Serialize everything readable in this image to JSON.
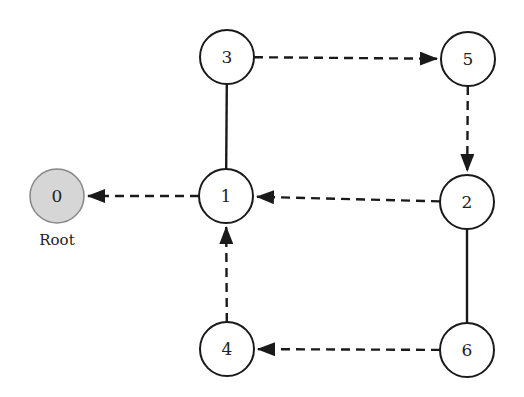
{
  "diagram": {
    "title": "",
    "colors": {
      "stroke": "#1a1a1a",
      "node_fill": "#ffffff",
      "root_fill": "#d6d6d6",
      "background": "#ffffff"
    },
    "nodes": [
      {
        "id": "0",
        "label": "0",
        "x": 57,
        "y": 196,
        "root": true,
        "caption": "Root"
      },
      {
        "id": "1",
        "label": "1",
        "x": 226,
        "y": 196
      },
      {
        "id": "2",
        "label": "2",
        "x": 467,
        "y": 202
      },
      {
        "id": "3",
        "label": "3",
        "x": 227,
        "y": 57
      },
      {
        "id": "4",
        "label": "4",
        "x": 227,
        "y": 349
      },
      {
        "id": "5",
        "label": "5",
        "x": 468,
        "y": 59
      },
      {
        "id": "6",
        "label": "6",
        "x": 467,
        "y": 350
      }
    ],
    "edges": [
      {
        "from": "1",
        "to": "0",
        "style": "dashed",
        "arrow": true
      },
      {
        "from": "3",
        "to": "1",
        "style": "solid",
        "arrow": false
      },
      {
        "from": "3",
        "to": "5",
        "style": "dashed",
        "arrow": true
      },
      {
        "from": "5",
        "to": "2",
        "style": "dashed",
        "arrow": true
      },
      {
        "from": "2",
        "to": "1",
        "style": "dashed",
        "arrow": true
      },
      {
        "from": "2",
        "to": "6",
        "style": "solid",
        "arrow": false
      },
      {
        "from": "6",
        "to": "4",
        "style": "dashed",
        "arrow": true
      },
      {
        "from": "4",
        "to": "1",
        "style": "dashed",
        "arrow": true
      }
    ]
  }
}
